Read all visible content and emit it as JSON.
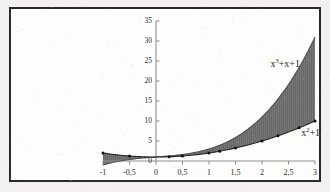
{
  "figure": {
    "title": "",
    "background_color": "#f2f1ef",
    "frame_color": "#2a2a2a",
    "plot_background": "#fdfdfc"
  },
  "axes": {
    "x_ticks": [
      "-1",
      "-0,5",
      "0",
      "0,5",
      "1",
      "1,5",
      "2",
      "2,5",
      "3"
    ],
    "x_tick_values": [
      -1,
      -0.5,
      0,
      0.5,
      1,
      1.5,
      2,
      2.5,
      3
    ],
    "y_ticks": [
      "0",
      "5",
      "10",
      "15",
      "20",
      "25",
      "30",
      "35"
    ],
    "y_tick_values": [
      0,
      5,
      10,
      15,
      20,
      25,
      30,
      35
    ],
    "axis_color": "#8a8a8a",
    "decimal_separator": ","
  },
  "labels": {
    "cubic_base": "x",
    "cubic_exp": "3",
    "cubic_rest": "+x+1",
    "cubic_full": "x³+x+1",
    "quadratic_base": "x",
    "quadratic_exp": "2",
    "quadratic_rest": "+1",
    "quadratic_full": "x²+1"
  },
  "chart_data": {
    "type": "area",
    "title": "",
    "xlabel": "",
    "ylabel": "",
    "xlim": [
      -1,
      3
    ],
    "ylim": [
      0,
      35
    ],
    "grid": false,
    "legend": "inline-annotation",
    "fill": {
      "between": [
        "x^3+x+1",
        "x^2+1"
      ],
      "color": "#6b6b6b",
      "description": "region enclosed between the two curves from x=-1 to x=3"
    },
    "x": [
      -1,
      -0.75,
      -0.5,
      -0.25,
      0,
      0.25,
      0.5,
      0.75,
      1,
      1.2,
      1.5,
      1.75,
      2,
      2.3,
      2.5,
      2.7,
      3
    ],
    "series": [
      {
        "name": "x³+x+1",
        "expression": "x^3 + x + 1",
        "values": [
          -1,
          -0.172,
          0.375,
          0.734,
          1,
          1.266,
          1.625,
          2.172,
          3,
          3.928,
          5.875,
          8.109,
          11,
          15.467,
          19.125,
          23.383,
          31
        ],
        "color": "#4a4a4a"
      },
      {
        "name": "x²+1",
        "expression": "x^2 + 1",
        "values": [
          2,
          1.5625,
          1.25,
          1.0625,
          1,
          1.0625,
          1.25,
          1.5625,
          2,
          2.44,
          3.25,
          4.0625,
          5,
          6.29,
          7.25,
          8.29,
          10
        ],
        "color": "#2b2b2b",
        "markers": true,
        "marker_x": [
          -1,
          -0.5,
          0.25,
          0.5,
          1,
          1.2,
          1.5,
          2,
          2.3,
          2.7,
          3
        ],
        "marker_y": [
          2,
          1.25,
          1.0625,
          1.25,
          2,
          2.44,
          3.25,
          5,
          6.29,
          8.29,
          10
        ]
      }
    ],
    "intersections": [
      {
        "x": -1,
        "note": "curves cross"
      },
      {
        "x": 0,
        "note": "curves cross"
      },
      {
        "x": 1,
        "note": "curves cross"
      }
    ]
  }
}
